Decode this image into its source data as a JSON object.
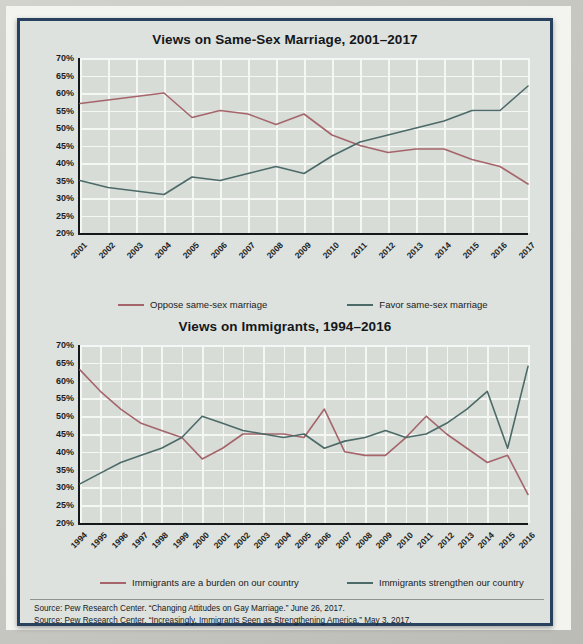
{
  "figure": {
    "background_color": "#dde2de",
    "frame_color": "#27415e",
    "oppose_color": "#a5656b",
    "favor_color": "#4c6a68"
  },
  "charts": [
    {
      "id": "same-sex-marriage",
      "title": "Views on Same-Sex Marriage, 2001–2017",
      "legend": [
        {
          "label": "Oppose same-sex marriage",
          "color": "#a5656b"
        },
        {
          "label": "Favor same-sex marriage",
          "color": "#4c6a68"
        }
      ]
    },
    {
      "id": "immigrants",
      "title": "Views on Immigrants, 1994–2016",
      "legend": [
        {
          "label": "Immigrants are a burden on our country",
          "color": "#a5656b"
        },
        {
          "label": "Immigrants strengthen our country",
          "color": "#4c6a68"
        }
      ]
    }
  ],
  "sources": [
    "Source: Pew Research Center. “Changing Attitudes on Gay Marriage.” June 26, 2017.",
    "Source: Pew Research Center. “Increasingly, Immigrants Seen as Strengthening America.” May 3, 2017."
  ],
  "chart_data": [
    {
      "type": "line",
      "title": "Views on Same-Sex Marriage, 2001–2017",
      "xlabel": "",
      "ylabel": "",
      "ylim": [
        20,
        70
      ],
      "yticks": [
        "20%",
        "25%",
        "30%",
        "35%",
        "40%",
        "45%",
        "50%",
        "55%",
        "60%",
        "65%",
        "70%"
      ],
      "ytick_values": [
        20,
        25,
        30,
        35,
        40,
        45,
        50,
        55,
        60,
        65,
        70
      ],
      "grid": true,
      "legend_position": "bottom",
      "categories": [
        "2001",
        "2002",
        "2003",
        "2004",
        "2005",
        "2006",
        "2007",
        "2008",
        "2009",
        "2010",
        "2011",
        "2012",
        "2013",
        "2014",
        "2015",
        "2016",
        "2017"
      ],
      "series": [
        {
          "name": "Oppose same-sex marriage",
          "color": "#a5656b",
          "values": [
            57,
            58,
            59,
            60,
            53,
            55,
            54,
            51,
            54,
            48,
            45,
            43,
            44,
            44,
            41,
            39,
            34
          ]
        },
        {
          "name": "Favor same-sex marriage",
          "color": "#4c6a68",
          "values": [
            35,
            33,
            32,
            31,
            36,
            35,
            37,
            39,
            37,
            42,
            46,
            48,
            50,
            52,
            55,
            55,
            62
          ]
        }
      ]
    },
    {
      "type": "line",
      "title": "Views on Immigrants, 1994–2016",
      "xlabel": "",
      "ylabel": "",
      "ylim": [
        20,
        70
      ],
      "yticks": [
        "20%",
        "25%",
        "30%",
        "35%",
        "40%",
        "45%",
        "50%",
        "55%",
        "60%",
        "65%",
        "70%"
      ],
      "ytick_values": [
        20,
        25,
        30,
        35,
        40,
        45,
        50,
        55,
        60,
        65,
        70
      ],
      "grid": true,
      "legend_position": "bottom",
      "categories": [
        "1994",
        "1995",
        "1996",
        "1997",
        "1998",
        "1999",
        "2000",
        "2001",
        "2002",
        "2003",
        "2004",
        "2005",
        "2006",
        "2007",
        "2008",
        "2009",
        "2010",
        "2011",
        "2012",
        "2013",
        "2014",
        "2015",
        "2016"
      ],
      "series": [
        {
          "name": "Immigrants are a burden on our country",
          "color": "#a5656b",
          "values": [
            63,
            57,
            52,
            48,
            46,
            44,
            38,
            41,
            45,
            45,
            45,
            44,
            52,
            40,
            39,
            39,
            44,
            50,
            45,
            41,
            37,
            39,
            28
          ]
        },
        {
          "name": "Immigrants strengthen our country",
          "color": "#4c6a68",
          "values": [
            31,
            34,
            37,
            39,
            41,
            44,
            50,
            48,
            46,
            45,
            44,
            45,
            41,
            43,
            44,
            46,
            44,
            45,
            48,
            52,
            57,
            41,
            64
          ]
        }
      ]
    }
  ]
}
